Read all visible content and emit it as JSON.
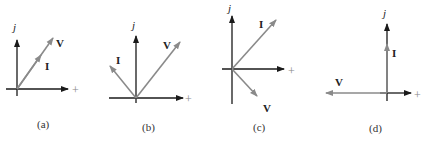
{
  "figure": {
    "axis_labels": {
      "imaginary": "j",
      "real": "+"
    },
    "colors": {
      "axis": "#1a1a1a",
      "phasor": "#8a8a8a",
      "text": "#222222"
    },
    "panels": [
      {
        "id": "a",
        "caption": "(a)",
        "description": "V and I in phase (I along V)",
        "phasors": [
          {
            "name": "V",
            "label": "V",
            "angle_deg": 55,
            "relative_length": 1.0
          },
          {
            "name": "I",
            "label": "I",
            "angle_deg": 55,
            "relative_length": 0.55
          }
        ]
      },
      {
        "id": "b",
        "caption": "(b)",
        "description": "I leads V by 90°",
        "phasors": [
          {
            "name": "V",
            "label": "V",
            "angle_deg": 52,
            "relative_length": 1.0
          },
          {
            "name": "I",
            "label": "I",
            "angle_deg": 142,
            "relative_length": 0.6
          }
        ]
      },
      {
        "id": "c",
        "caption": "(c)",
        "description": "I leads V by 90°",
        "phasors": [
          {
            "name": "I",
            "label": "I",
            "angle_deg": 48,
            "relative_length": 1.0
          },
          {
            "name": "V",
            "label": "V",
            "angle_deg": -48,
            "relative_length": 0.6
          }
        ]
      },
      {
        "id": "d",
        "caption": "(d)",
        "description": "V along negative real axis, I along +j axis",
        "phasors": [
          {
            "name": "V",
            "label": "V",
            "angle_deg": 180,
            "relative_length": 1.0
          },
          {
            "name": "I",
            "label": "I",
            "angle_deg": 90,
            "relative_length": 0.7
          }
        ]
      }
    ]
  }
}
